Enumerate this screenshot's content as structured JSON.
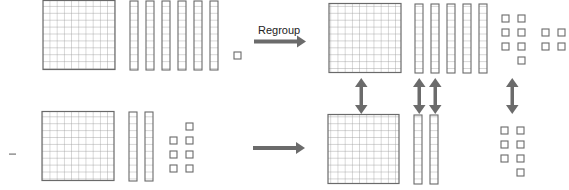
{
  "colors": {
    "block_stroke": "#6a6a6a",
    "grid_line": "#9a9a9a",
    "arrow": "#6b6b6b",
    "background": "#ffffff"
  },
  "labels": {
    "regroup": "Regroup",
    "minus": "–"
  },
  "rows": {
    "minuend_original": {
      "hundreds": 1,
      "tens": 6,
      "ones": 1
    },
    "subtrahend": {
      "hundreds": 1,
      "tens": 2,
      "ones": 7
    },
    "minuend_regrouped": {
      "hundreds": 1,
      "tens": 5,
      "ones": 11
    },
    "subtrahend_aligned": {
      "hundreds": 1,
      "tens": 2,
      "ones": 7
    }
  },
  "icons": {
    "regroup_arrow": "right-arrow-icon",
    "combine_arrow": "right-arrow-icon",
    "match_arrow": "up-down-arrow-icon"
  }
}
